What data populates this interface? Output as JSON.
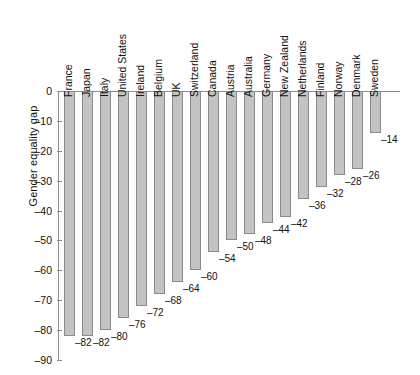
{
  "chart_data": {
    "type": "bar",
    "title": "",
    "xlabel": "",
    "ylabel": "Gender equality gap",
    "ylim": [
      -90,
      0
    ],
    "yticks": [
      0,
      -10,
      -20,
      -30,
      -40,
      -50,
      -60,
      -70,
      -80,
      -90
    ],
    "ytick_labels": [
      "0",
      "–10",
      "–20",
      "–30",
      "–40",
      "–50",
      "–60",
      "–70",
      "–80",
      "–90"
    ],
    "grid": false,
    "legend": null,
    "orientation": "vertical-downward",
    "bar_color": "#c3c3c3",
    "bar_edge_color": "#8a8a8a",
    "axis_color": "#8c8c8c",
    "categories": [
      "France",
      "Japan",
      "Italy",
      "United States",
      "Ireland",
      "Belgium",
      "UK",
      "Switzerland",
      "Canada",
      "Austria",
      "Australia",
      "Germany",
      "New Zealand",
      "Netherlands",
      "Finland",
      "Norway",
      "Denmark",
      "Sweden"
    ],
    "values": [
      -82,
      -82,
      -80,
      -76,
      -72,
      -68,
      -64,
      -60,
      -54,
      -50,
      -48,
      -44,
      -42,
      -36,
      -32,
      -28,
      -26,
      -14
    ],
    "value_labels": [
      "–82",
      "–82",
      "–80",
      "–76",
      "–72",
      "–68",
      "–64",
      "–60",
      "–54",
      "–50",
      "–48",
      "–44",
      "–42",
      "–36",
      "–32",
      "–28",
      "–26",
      "–14"
    ]
  }
}
